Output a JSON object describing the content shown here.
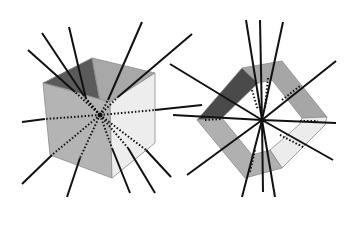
{
  "figure": {
    "background": "#ffffff",
    "ray_color": "#111111",
    "left_cube": {
      "center": [
        100,
        115
      ],
      "faces": {
        "back_left": {
          "points": [
            [
              43,
              83
            ],
            [
              92,
              58
            ],
            [
              100,
              102
            ],
            [
              70,
              90
            ]
          ],
          "fill": "#5a5a5a"
        },
        "back_right": {
          "points": [
            [
              92,
              58
            ],
            [
              155,
              73
            ],
            [
              110,
              102
            ],
            [
              100,
              100
            ]
          ],
          "fill": "#a8a8a8"
        },
        "front_left": {
          "points": [
            [
              43,
              83
            ],
            [
              110,
              102
            ],
            [
              112,
              178
            ],
            [
              50,
              155
            ]
          ],
          "fill": "#b4b4b4"
        },
        "front_right": {
          "points": [
            [
              110,
              102
            ],
            [
              155,
              73
            ],
            [
              155,
              143
            ],
            [
              112,
              178
            ]
          ],
          "fill": "#ededed"
        }
      },
      "rays": [
        [
          28,
          50
        ],
        [
          42,
          33
        ],
        [
          69,
          27
        ],
        [
          142,
          22
        ],
        [
          192,
          34
        ],
        [
          22,
          122
        ],
        [
          202,
          105
        ],
        [
          22,
          184
        ],
        [
          67,
          197
        ],
        [
          130,
          193
        ],
        [
          155,
          193
        ],
        [
          171,
          177
        ]
      ],
      "ray_inside_start": [
        [
          75,
          92
        ],
        [
          84,
          96
        ],
        [
          86,
          99
        ],
        [
          108,
          100
        ],
        [
          118,
          97
        ],
        [
          45,
          119
        ],
        [
          155,
          110
        ],
        [
          52,
          155
        ],
        [
          80,
          158
        ],
        [
          112,
          148
        ],
        [
          128,
          148
        ],
        [
          146,
          150
        ]
      ]
    },
    "right_ring": {
      "center": [
        262,
        120
      ],
      "outer": [
        [
          242,
          68
        ],
        [
          282,
          61
        ],
        [
          327,
          117
        ],
        [
          325,
          125
        ],
        [
          282,
          168
        ],
        [
          245,
          178
        ],
        [
          197,
          120
        ]
      ],
      "inner": [
        [
          258,
          83
        ],
        [
          272,
          80
        ],
        [
          302,
          118
        ],
        [
          300,
          124
        ],
        [
          270,
          150
        ],
        [
          252,
          155
        ],
        [
          222,
          118
        ]
      ],
      "segments": {
        "top_left": {
          "points": [
            [
              242,
              68
            ],
            [
              258,
              83
            ],
            [
              222,
              118
            ],
            [
              197,
              120
            ]
          ],
          "fill": "#4a4a4a"
        },
        "top_right": {
          "points": [
            [
              242,
              68
            ],
            [
              282,
              61
            ],
            [
              327,
              117
            ],
            [
              302,
              118
            ],
            [
              272,
              80
            ],
            [
              258,
              83
            ]
          ],
          "fill": "#a6a6a6"
        },
        "bottom_right": {
          "points": [
            [
              327,
              117
            ],
            [
              325,
              125
            ],
            [
              282,
              168
            ],
            [
              270,
              150
            ],
            [
              300,
              124
            ],
            [
              302,
              118
            ]
          ],
          "fill": "#ececec"
        },
        "bottom_left": {
          "points": [
            [
              197,
              120
            ],
            [
              222,
              118
            ],
            [
              252,
              155
            ],
            [
              270,
              150
            ],
            [
              282,
              168
            ],
            [
              245,
              178
            ]
          ],
          "fill": "#b0b0b0"
        }
      },
      "rays": [
        [
          246,
          20
        ],
        [
          260,
          20
        ],
        [
          283,
          22
        ],
        [
          170,
          64
        ],
        [
          336,
          61
        ],
        [
          173,
          115
        ],
        [
          336,
          123
        ],
        [
          187,
          175
        ],
        [
          333,
          160
        ],
        [
          242,
          197
        ],
        [
          263,
          192
        ],
        [
          275,
          197
        ]
      ]
    }
  }
}
